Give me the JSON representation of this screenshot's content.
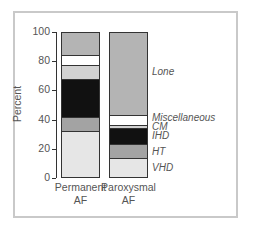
{
  "chart_data": {
    "type": "bar",
    "stacked": true,
    "title": "",
    "xlabel": "",
    "ylabel": "Percent",
    "ylim": [
      0,
      100
    ],
    "yticks": [
      0,
      20,
      40,
      60,
      80,
      100
    ],
    "grid": false,
    "legend_position": "right (inline labels)",
    "categories": [
      "Permanent AF",
      "Paroxysmal AF"
    ],
    "category_lines": [
      [
        "Permanent",
        "AF"
      ],
      [
        "Paroxysmal",
        "AF"
      ]
    ],
    "series": [
      {
        "name": "VHD",
        "values": [
          32,
          13
        ],
        "color": "#e6e6e6"
      },
      {
        "name": "HT",
        "values": [
          10,
          10
        ],
        "color": "#a3a3a3"
      },
      {
        "name": "IHD",
        "values": [
          26,
          11
        ],
        "color": "#111111"
      },
      {
        "name": "CM",
        "values": [
          10,
          2
        ],
        "color": "#d2d2d2"
      },
      {
        "name": "Miscellaneous",
        "values": [
          7,
          7
        ],
        "color": "#ffffff"
      },
      {
        "name": "Lone",
        "values": [
          15,
          57
        ],
        "color": "#b4b4b4"
      }
    ]
  }
}
